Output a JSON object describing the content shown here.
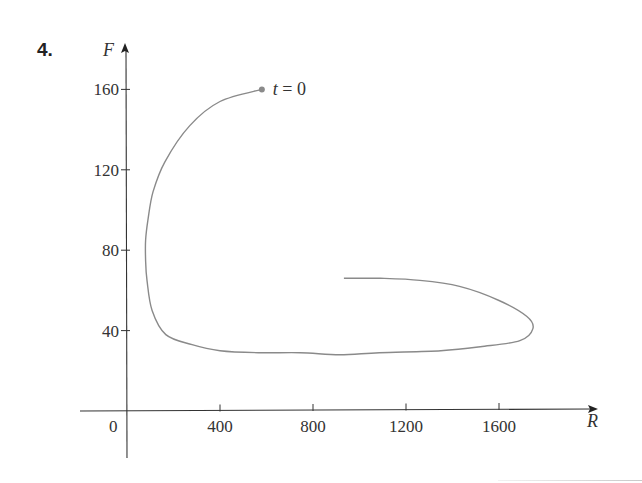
{
  "problem": {
    "number": "4."
  },
  "chart_data": {
    "type": "line",
    "title": "",
    "xlabel": "R",
    "ylabel": "F",
    "xlim": [
      -200,
      2050
    ],
    "ylim": [
      -20,
      180
    ],
    "grid": false,
    "legend": null,
    "x_ticks": [
      0,
      400,
      800,
      1200,
      1600
    ],
    "x_tick_labels": [
      "0",
      "400",
      "800",
      "1200",
      "1600"
    ],
    "y_ticks": [
      40,
      80,
      120,
      160
    ],
    "y_tick_labels": [
      "40",
      "80",
      "120",
      "160"
    ],
    "annotations": [
      {
        "text_var": "t",
        "text_rest": " = 0",
        "text": "t = 0",
        "x": 580,
        "y": 160,
        "marker": "dot"
      }
    ],
    "series": [
      {
        "name": "phase trajectory (R, F)",
        "color": "#8a8a8a",
        "points": [
          [
            580,
            160
          ],
          [
            400,
            154
          ],
          [
            270,
            142
          ],
          [
            163,
            124
          ],
          [
            112,
            109
          ],
          [
            90,
            95
          ],
          [
            80,
            85
          ],
          [
            80,
            75
          ],
          [
            86,
            65
          ],
          [
            108,
            50
          ],
          [
            167,
            38
          ],
          [
            280,
            33
          ],
          [
            400,
            30
          ],
          [
            565,
            29
          ],
          [
            745,
            29
          ],
          [
            915,
            28
          ],
          [
            1085,
            29
          ],
          [
            1350,
            30
          ],
          [
            1520,
            32
          ],
          [
            1690,
            35
          ],
          [
            1746,
            41
          ],
          [
            1720,
            47
          ],
          [
            1600,
            55
          ],
          [
            1430,
            62
          ],
          [
            1260,
            65
          ],
          [
            1090,
            66
          ],
          [
            933,
            66
          ]
        ]
      }
    ]
  },
  "layout": {
    "origin_px": [
      127,
      411
    ],
    "px_per_unit_x": 0.2325,
    "px_per_unit_y": 2.01,
    "x_axis_px": [
      80,
      598
    ],
    "y_axis_px": [
      43,
      458
    ]
  }
}
